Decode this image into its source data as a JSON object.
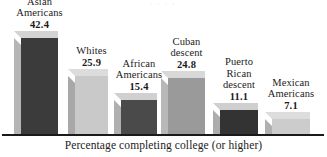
{
  "figure": {
    "top_artifact": ". . . .",
    "baseline_color": "#1a1a1a",
    "background": "#ffffff"
  },
  "chart_data": {
    "type": "bar",
    "title": "",
    "subtitle": "",
    "xlabel": "Percentage completing college (or higher)",
    "ylabel": "",
    "ylim": [
      0,
      42.4
    ],
    "grid": false,
    "legend": "none",
    "style": "3d-bars-grayscale",
    "categories": [
      "Asian Americans",
      "Whites",
      "African Americans",
      "Cuban descent",
      "Puerto Rican descent",
      "Mexican Americans"
    ],
    "values": [
      42.4,
      25.9,
      15.4,
      24.8,
      11.1,
      7.1
    ],
    "value_labels": [
      "42.4",
      "25.9",
      "15.4",
      "24.8",
      "11.1",
      "7.1"
    ],
    "bar_colors": [
      "#3b3b3b",
      "#c9c9c9",
      "#4a4a4a",
      "#9a9a9a",
      "#333333",
      "#cccccc"
    ],
    "bars": [
      {
        "category_lines": [
          "Asian",
          "Americans"
        ],
        "value_label": "42.4",
        "value": 42.4,
        "front_color": "#3b3b3b",
        "side_color": "#b5b5b5",
        "top_color": "#d3d3d3"
      },
      {
        "category_lines": [
          "Whites"
        ],
        "value_label": "25.9",
        "value": 25.9,
        "front_color": "#c9c9c9",
        "side_color": "#a8a8a8",
        "top_color": "#dcdcdc"
      },
      {
        "category_lines": [
          "African",
          "Americans"
        ],
        "value_label": "15.4",
        "value": 15.4,
        "front_color": "#4a4a4a",
        "side_color": "#b0b0b0",
        "top_color": "#d0d0d0"
      },
      {
        "category_lines": [
          "Cuban",
          "descent"
        ],
        "value_label": "24.8",
        "value": 24.8,
        "front_color": "#9a9a9a",
        "side_color": "#b8b8b8",
        "top_color": "#d8d8d8"
      },
      {
        "category_lines": [
          "Puerto",
          "Rican",
          "descent"
        ],
        "value_label": "11.1",
        "value": 11.1,
        "front_color": "#333333",
        "side_color": "#adadad",
        "top_color": "#cfcfcf"
      },
      {
        "category_lines": [
          "Mexican",
          "Americans"
        ],
        "value_label": "7.1",
        "value": 7.1,
        "front_color": "#cccccc",
        "side_color": "#b0b0b0",
        "top_color": "#dddddd"
      }
    ]
  }
}
